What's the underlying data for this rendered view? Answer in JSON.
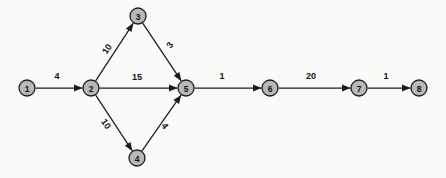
{
  "diagram": {
    "background_color": "#fbfaf8",
    "node_fill_color": "#b8b8b8",
    "node_stroke_color": "#1c1c1c",
    "edge_color": "#1a1a1a",
    "label_color": "#111111",
    "nodes": [
      {
        "id": "1",
        "label": "1",
        "x": 27,
        "y": 88
      },
      {
        "id": "2",
        "label": "2",
        "x": 91,
        "y": 88
      },
      {
        "id": "3",
        "label": "3",
        "x": 138,
        "y": 16
      },
      {
        "id": "4",
        "label": "4",
        "x": 137,
        "y": 158
      },
      {
        "id": "5",
        "label": "5",
        "x": 186,
        "y": 88
      },
      {
        "id": "6",
        "label": "6",
        "x": 270,
        "y": 88
      },
      {
        "id": "7",
        "label": "7",
        "x": 359,
        "y": 88
      },
      {
        "id": "8",
        "label": "8",
        "x": 419,
        "y": 88
      }
    ],
    "node_radius": 8,
    "edges": [
      {
        "id": "e1",
        "from": "1",
        "to": "2",
        "weight": "4",
        "label_x": 57,
        "label_y": 76,
        "rotation": 0
      },
      {
        "id": "e2",
        "from": "2",
        "to": "3",
        "weight": "10",
        "label_x": 107,
        "label_y": 49,
        "rotation": -57
      },
      {
        "id": "e3",
        "from": "3",
        "to": "5",
        "weight": "3",
        "label_x": 170,
        "label_y": 45,
        "rotation": -56
      },
      {
        "id": "e4",
        "from": "2",
        "to": "5",
        "weight": "15",
        "label_x": 137,
        "label_y": 77,
        "rotation": 0
      },
      {
        "id": "e5",
        "from": "2",
        "to": "4",
        "weight": "10",
        "label_x": 106,
        "label_y": 124,
        "rotation": 55
      },
      {
        "id": "e6",
        "from": "4",
        "to": "5",
        "weight": "4",
        "label_x": 165,
        "label_y": 126,
        "rotation": 56
      },
      {
        "id": "e7",
        "from": "5",
        "to": "6",
        "weight": "1",
        "label_x": 222,
        "label_y": 76,
        "rotation": 0
      },
      {
        "id": "e8",
        "from": "6",
        "to": "7",
        "weight": "20",
        "label_x": 311,
        "label_y": 76,
        "rotation": 0
      },
      {
        "id": "e9",
        "from": "7",
        "to": "8",
        "weight": "1",
        "label_x": 386,
        "label_y": 76,
        "rotation": 0
      }
    ]
  }
}
